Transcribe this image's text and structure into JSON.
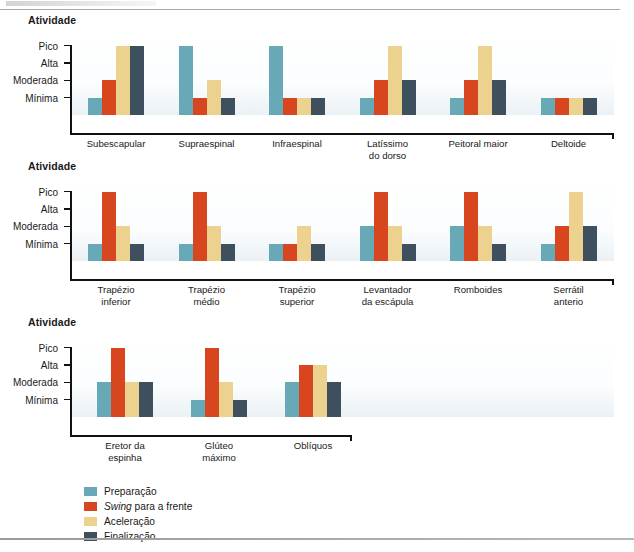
{
  "colors": {
    "preparacao": "#68a9b7",
    "swing": "#d8461f",
    "aceleracao": "#ecd28e",
    "finalizacao": "#3e505e",
    "axis": "#111111",
    "rule": "#a8a8a8"
  },
  "axis": {
    "title": "Atividade",
    "tick_labels": [
      "Pico",
      "Alta",
      "Moderada",
      "Mínima"
    ],
    "tick_values": [
      4,
      3,
      2,
      1
    ]
  },
  "legend": {
    "position": "bottom-left",
    "items": [
      {
        "label": "Preparação",
        "label_prefix": "",
        "label_italic": "",
        "color_key": "preparacao"
      },
      {
        "label": "Swing para a frente",
        "label_prefix": "",
        "label_italic": "Swing",
        "label_rest": " para a frente",
        "color_key": "swing"
      },
      {
        "label": "Aceleração",
        "label_prefix": "",
        "label_italic": "",
        "color_key": "aceleracao"
      },
      {
        "label": "Finalização",
        "label_prefix": "",
        "label_italic": "",
        "color_key": "finalizacao"
      }
    ]
  },
  "chart_data": [
    {
      "type": "bar",
      "title": "",
      "xlabel": "",
      "ylabel": "Atividade",
      "ylim": [
        0,
        4.45
      ],
      "grid": false,
      "ytick_labels": [
        "Pico",
        "Alta",
        "Moderada",
        "Mínima"
      ],
      "ytick_values": [
        4,
        3,
        2,
        1
      ],
      "categories": [
        "Subescapular",
        "Supraespinal",
        "Infraespinal",
        "Latíssimo\ndo dorso",
        "Peitoral maior",
        "Deltoide"
      ],
      "series": [
        {
          "name": "Preparação",
          "values": [
            1,
            4,
            4,
            1,
            1,
            1
          ]
        },
        {
          "name": "Swing para a frente",
          "values": [
            2,
            1,
            1,
            2,
            2,
            1
          ]
        },
        {
          "name": "Aceleração",
          "values": [
            4,
            2,
            1,
            4,
            4,
            1
          ]
        },
        {
          "name": "Finalização",
          "values": [
            4,
            1,
            1,
            2,
            2,
            1
          ]
        }
      ]
    },
    {
      "type": "bar",
      "title": "",
      "xlabel": "",
      "ylabel": "Atividade",
      "ylim": [
        0,
        4.45
      ],
      "grid": false,
      "ytick_labels": [
        "Pico",
        "Alta",
        "Moderada",
        "Mínima"
      ],
      "ytick_values": [
        4,
        3,
        2,
        1
      ],
      "categories": [
        "Trapézio\ninferior",
        "Trapézio\nmédio",
        "Trapézio\nsuperior",
        "Levantador\nda escápula",
        "Romboides",
        "Serrátil\nanterio"
      ],
      "series": [
        {
          "name": "Preparação",
          "values": [
            1,
            1,
            1,
            2,
            2,
            1
          ]
        },
        {
          "name": "Swing para a frente",
          "values": [
            4,
            4,
            1,
            4,
            4,
            2
          ]
        },
        {
          "name": "Aceleração",
          "values": [
            2,
            2,
            2,
            2,
            2,
            4
          ]
        },
        {
          "name": "Finalização",
          "values": [
            1,
            1,
            1,
            1,
            1,
            2
          ]
        }
      ]
    },
    {
      "type": "bar",
      "title": "",
      "xlabel": "",
      "ylabel": "Atividade",
      "ylim": [
        0,
        4.45
      ],
      "grid": false,
      "ytick_labels": [
        "Pico",
        "Alta",
        "Moderada",
        "Mínima"
      ],
      "ytick_values": [
        4,
        3,
        2,
        1
      ],
      "categories": [
        "Eretor da\nespinha",
        "Glúteo\nmáximo",
        "Oblíquos"
      ],
      "series": [
        {
          "name": "Preparação",
          "values": [
            2,
            1,
            2
          ]
        },
        {
          "name": "Swing para a frente",
          "values": [
            4,
            4,
            3
          ]
        },
        {
          "name": "Aceleração",
          "values": [
            2,
            2,
            3
          ]
        },
        {
          "name": "Finalização",
          "values": [
            2,
            1,
            2
          ]
        }
      ]
    }
  ]
}
